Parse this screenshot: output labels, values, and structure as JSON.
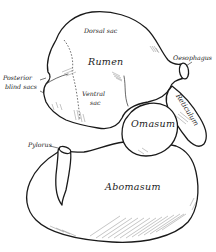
{
  "figure": {
    "labels": {
      "dorsal_sac": "Dorsal sac",
      "rumen": "Rumen",
      "oesophagus": "Oesophagus",
      "posterior_blind_sacs_line1": "Posterior",
      "posterior_blind_sacs_line2": "blind sacs",
      "ventral_sac_line1": "Ventral",
      "ventral_sac_line2": "sac",
      "reticulum": "Reticulum",
      "omasum": "Omasum",
      "pylorus": "Pylorus",
      "abomasum": "Abomasum"
    },
    "colors": {
      "line": "#1a1a1a",
      "hatching": "#8a8a8a",
      "background": "#ffffff"
    }
  }
}
